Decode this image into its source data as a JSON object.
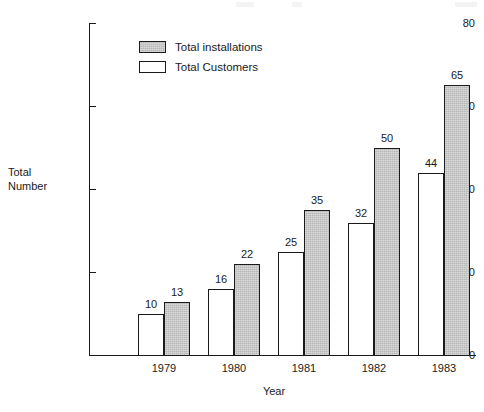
{
  "chart_data": {
    "type": "bar",
    "title": "",
    "xlabel": "Year",
    "ylabel": "Total Number",
    "ylabel_lines": [
      "Total",
      "Number"
    ],
    "categories": [
      "1979",
      "1980",
      "1981",
      "1982",
      "1983"
    ],
    "series": [
      {
        "name": "Total Customers",
        "values": [
          10,
          16,
          25,
          32,
          44
        ],
        "fill": "#ffffff",
        "style": "open"
      },
      {
        "name": "Total installations",
        "values": [
          13,
          22,
          35,
          50,
          65
        ],
        "fill": "#b7b7b7",
        "style": "shaded"
      }
    ],
    "ylim": [
      0,
      80
    ],
    "yticks": [
      0,
      20,
      40,
      60,
      80
    ],
    "ytick_labels": [
      "0",
      "20",
      "40",
      "60",
      "80"
    ],
    "grid": false,
    "data_labels": true,
    "legend": {
      "position": "top-left-inside",
      "entries": [
        {
          "label": "Total installations",
          "swatch": "shaded"
        },
        {
          "label": "Total Customers",
          "swatch": "plain"
        }
      ]
    }
  }
}
